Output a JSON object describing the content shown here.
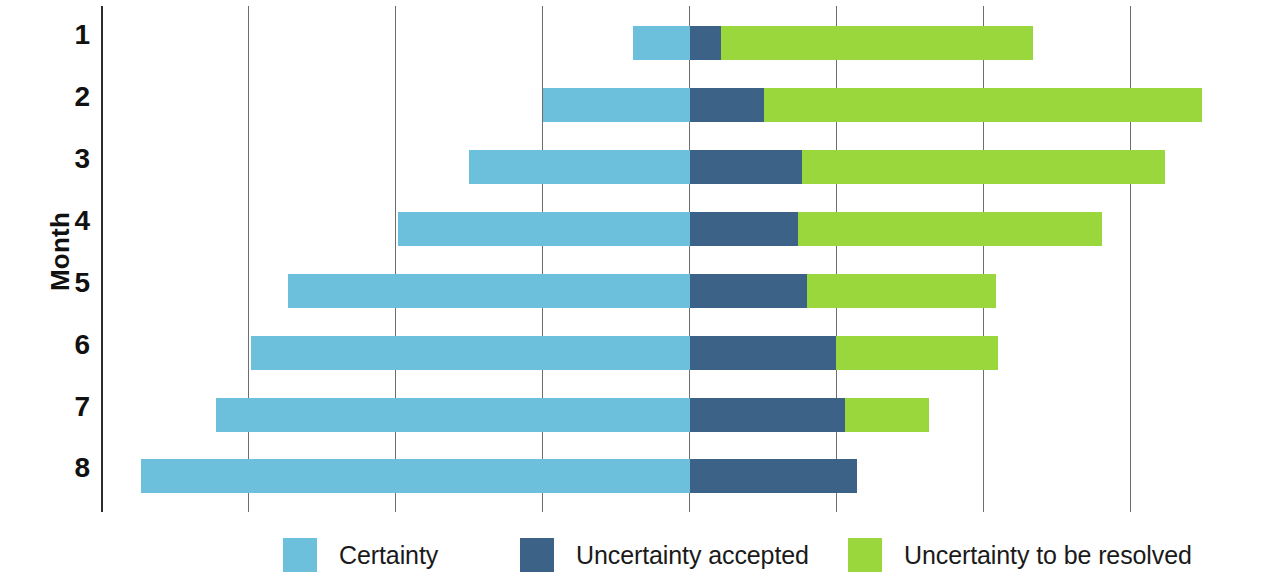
{
  "axes": {
    "y_title": "Month",
    "y_tick_labels": [
      "1",
      "2",
      "3",
      "4",
      "5",
      "6",
      "7",
      "8"
    ]
  },
  "legend": [
    {
      "label": "Certainty",
      "color": "#6cc0dc",
      "key": "certainty"
    },
    {
      "label": "Uncertainty accepted",
      "color": "#3c6387",
      "key": "accepted"
    },
    {
      "label": "Uncertainty to be resolved",
      "color": "#9ad73c",
      "key": "resolved"
    }
  ],
  "chart_data": {
    "type": "bar",
    "orientation": "horizontal",
    "stacked": true,
    "floating": true,
    "title": "",
    "xlabel": "",
    "ylabel": "Month",
    "categories": [
      "1",
      "2",
      "3",
      "4",
      "5",
      "6",
      "7",
      "8"
    ],
    "grid": "vertical",
    "legend_position": "bottom",
    "xlim": [
      0,
      8
    ],
    "x_gridline_values": [
      0,
      1,
      2,
      3,
      4,
      5,
      6,
      7
    ],
    "note": "Values are in gridline units measured from the y-axis (1 unit = one gridline spacing). Each month's bar floats: it starts at 'start', the Certainty segment runs to 'certainty_end', the Uncertainty-accepted segment to 'accepted_end', and the Uncertainty-to-be-resolved segment to 'resolved_end'.",
    "series": [
      {
        "name": "Certainty",
        "color": "#6cc0dc"
      },
      {
        "name": "Uncertainty accepted",
        "color": "#3c6387"
      },
      {
        "name": "Uncertainty to be resolved",
        "color": "#9ad73c"
      }
    ],
    "bars": [
      {
        "month": "1",
        "start": 3.62,
        "certainty_end": 4.01,
        "accepted_end": 4.22,
        "resolved_end": 6.34
      },
      {
        "month": "2",
        "start": 3.01,
        "certainty_end": 4.01,
        "accepted_end": 4.51,
        "resolved_end": 7.49
      },
      {
        "month": "3",
        "start": 2.5,
        "certainty_end": 4.01,
        "accepted_end": 4.77,
        "resolved_end": 7.24
      },
      {
        "month": "4",
        "start": 2.02,
        "certainty_end": 4.01,
        "accepted_end": 4.74,
        "resolved_end": 6.81
      },
      {
        "month": "5",
        "start": 1.27,
        "certainty_end": 4.01,
        "accepted_end": 4.8,
        "resolved_end": 6.09
      },
      {
        "month": "6",
        "start": 1.02,
        "certainty_end": 4.01,
        "accepted_end": 5.0,
        "resolved_end": 6.1
      },
      {
        "month": "7",
        "start": 0.78,
        "certainty_end": 4.01,
        "accepted_end": 5.06,
        "resolved_end": 5.63
      },
      {
        "month": "8",
        "start": 0.27,
        "certainty_end": 4.01,
        "accepted_end": 5.14,
        "resolved_end": 5.14
      }
    ]
  },
  "geometry": {
    "axis_x_px": 101,
    "gridline_spacing_px": 147,
    "row_tops_px": [
      20,
      82,
      144,
      206,
      268,
      330,
      392,
      453
    ],
    "bar_height_px": 34,
    "legend_item_left_px": [
      283,
      520,
      848
    ]
  }
}
